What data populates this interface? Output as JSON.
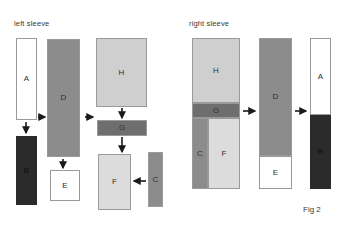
{
  "figure": {
    "caption": "Fig 2",
    "panels": [
      {
        "id": "left",
        "title": "left sleeve"
      },
      {
        "id": "right",
        "title": "right sleeve"
      }
    ]
  },
  "colors": {
    "white": "#ffffff",
    "near_black": "#2b2b2b",
    "mid_gray": "#8c8c8c",
    "dark_gray": "#6e6e6e",
    "light_gray": "#cfcfcf",
    "pale_gray": "#dcdcdc",
    "outline": "#9a9a9a",
    "text": "#3a3a3a",
    "arrow": "#1a1a1a"
  },
  "left_panel": {
    "title": "left sleeve",
    "pieces": [
      {
        "key": "A",
        "label": "A",
        "fill": "#ffffff",
        "x": 16,
        "y": 38,
        "w": 21,
        "h": 82
      },
      {
        "key": "B",
        "label": "B",
        "fill": "#2b2b2b",
        "x": 16,
        "y": 136,
        "w": 21,
        "h": 69
      },
      {
        "key": "D",
        "label": "D",
        "fill": "#8c8c8c",
        "x": 47,
        "y": 39,
        "w": 33,
        "h": 118
      },
      {
        "key": "E",
        "label": "E",
        "fill": "#ffffff",
        "x": 50,
        "y": 170,
        "w": 30,
        "h": 31
      },
      {
        "key": "H",
        "label": "H",
        "fill": "#cfcfcf",
        "x": 96,
        "y": 38,
        "w": 51,
        "h": 69
      },
      {
        "key": "G",
        "label": "G",
        "fill": "#6e6e6e",
        "x": 97,
        "y": 120,
        "w": 50,
        "h": 16
      },
      {
        "key": "F",
        "label": "F",
        "fill": "#dcdcdc",
        "x": 98,
        "y": 154,
        "w": 33,
        "h": 56
      },
      {
        "key": "C",
        "label": "C",
        "fill": "#8c8c8c",
        "x": 148,
        "y": 152,
        "w": 15,
        "h": 55
      }
    ],
    "arrows": [
      {
        "from": "A",
        "to": "B",
        "dir": "down",
        "x1": 26,
        "y1": 122,
        "x2": 26,
        "y2": 134
      },
      {
        "from": "A",
        "to": "D",
        "dir": "right",
        "x1": 37,
        "y1": 117,
        "x2": 46,
        "y2": 117
      },
      {
        "from": "D",
        "to": "H",
        "dir": "right",
        "x1": 84,
        "y1": 117,
        "x2": 94,
        "y2": 117
      },
      {
        "from": "D",
        "to": "E",
        "dir": "down",
        "x1": 63,
        "y1": 158,
        "x2": 63,
        "y2": 169
      },
      {
        "from": "H",
        "to": "G",
        "dir": "down",
        "x1": 122,
        "y1": 108,
        "x2": 122,
        "y2": 119
      },
      {
        "from": "G",
        "to": "F",
        "dir": "down",
        "x1": 122,
        "y1": 137,
        "x2": 122,
        "y2": 153
      },
      {
        "from": "C",
        "to": "F",
        "dir": "left",
        "x1": 146,
        "y1": 181,
        "x2": 133,
        "y2": 181
      }
    ]
  },
  "right_panel": {
    "title": "right sleeve",
    "stage1": {
      "name": "assembled-sleeve-panel",
      "x": 192,
      "y": 38,
      "w": 48,
      "h": 151,
      "pieces": [
        {
          "key": "H",
          "label": "H",
          "fill": "#cfcfcf",
          "x": 192,
          "y": 38,
          "w": 48,
          "h": 65
        },
        {
          "key": "G",
          "label": "G",
          "fill": "#6e6e6e",
          "x": 192,
          "y": 103,
          "w": 48,
          "h": 15
        },
        {
          "key": "C",
          "label": "C",
          "fill": "#8c8c8c",
          "x": 192,
          "y": 118,
          "w": 16,
          "h": 71
        },
        {
          "key": "F",
          "label": "F",
          "fill": "#dcdcdc",
          "x": 208,
          "y": 118,
          "w": 32,
          "h": 71
        }
      ]
    },
    "stage2": {
      "name": "sleeve-with-cuff-panel",
      "x": 259,
      "y": 38,
      "w": 33,
      "h": 151,
      "pieces": [
        {
          "key": "D",
          "label": "D",
          "fill": "#8c8c8c",
          "x": 259,
          "y": 38,
          "w": 33,
          "h": 118
        },
        {
          "key": "E",
          "label": "E",
          "fill": "#ffffff",
          "x": 259,
          "y": 156,
          "w": 33,
          "h": 33
        }
      ]
    },
    "stage3": {
      "name": "finished-sleeve-panel",
      "x": 310,
      "y": 38,
      "w": 21,
      "h": 151,
      "pieces": [
        {
          "key": "A",
          "label": "A",
          "fill": "#ffffff",
          "x": 310,
          "y": 38,
          "w": 21,
          "h": 77
        },
        {
          "key": "B",
          "label": "B",
          "fill": "#2b2b2b",
          "x": 310,
          "y": 115,
          "w": 21,
          "h": 74
        }
      ]
    },
    "arrows": [
      {
        "from": "stage1",
        "to": "stage2",
        "dir": "right",
        "x1": 243,
        "y1": 111,
        "x2": 256,
        "y2": 111
      },
      {
        "from": "stage2",
        "to": "stage3",
        "dir": "right",
        "x1": 295,
        "y1": 111,
        "x2": 307,
        "y2": 111
      }
    ]
  }
}
